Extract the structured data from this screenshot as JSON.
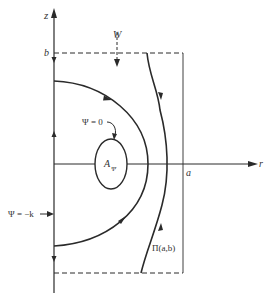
{
  "diagram": {
    "type": "streamline-region",
    "colors": {
      "line": "#2a2a2a",
      "background": "#ffffff",
      "text": "#333333"
    },
    "axes": {
      "vertical_label": "z",
      "horizontal_label": "r",
      "top_marker": "b",
      "right_marker": "a"
    },
    "labels": {
      "inflow": "W",
      "inner_stream": "Ψ = 0",
      "region_base": "A",
      "region_sub": "Ψ",
      "axis_stream": "Ψ = −k",
      "domain": "Π(a,b)"
    }
  }
}
